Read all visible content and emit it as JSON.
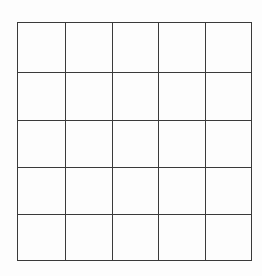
{
  "grid": {
    "rows": 5,
    "columns": 5,
    "line_color": "#3a3a3a",
    "background": "#fdfdfd",
    "cells": [
      [
        "",
        "",
        "",
        "",
        ""
      ],
      [
        "",
        "",
        "",
        "",
        ""
      ],
      [
        "",
        "",
        "",
        "",
        ""
      ],
      [
        "",
        "",
        "",
        "",
        ""
      ],
      [
        "",
        "",
        "",
        "",
        ""
      ]
    ]
  }
}
